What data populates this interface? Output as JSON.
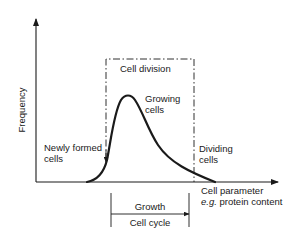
{
  "diagram": {
    "y_axis": {
      "label": "Frequency"
    },
    "x_axis": {
      "label_line1": "Cell parameter",
      "label_line2_prefix": "e.g.",
      "label_line2_rest": " protein content"
    },
    "box": {
      "label": "Cell division"
    },
    "annotations": {
      "growing": [
        "Growing",
        "cells"
      ],
      "newly": [
        "Newly formed",
        "cells"
      ],
      "dividing": [
        "Dividing",
        "cells"
      ]
    },
    "bracket": {
      "top_label": "Growth",
      "bottom_label": "Cell cycle"
    },
    "colors": {
      "ink": "#1a1a1a",
      "background": "#ffffff"
    }
  }
}
